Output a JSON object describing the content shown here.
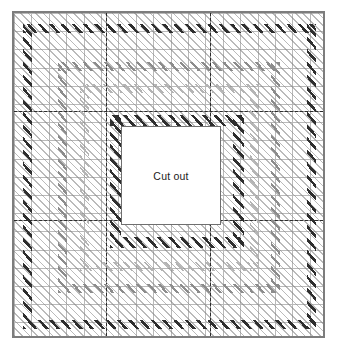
{
  "figure": {
    "type": "mesh-diagram",
    "width_px": 339,
    "height_px": 349
  },
  "plate": {
    "name": "plate-outline",
    "left_px": 12,
    "top_px": 11,
    "width_px": 313,
    "height_px": 327,
    "outline_color": "#7d7d7d",
    "fill_color": "#ffffff",
    "mesh_color": "#b9b9b9",
    "mesh_cols": 18,
    "mesh_rows": 18
  },
  "cutout": {
    "name": "cut-out-region",
    "label": "Cut out",
    "left_px": 119,
    "top_px": 124,
    "width_px": 100,
    "height_px": 99,
    "outline_color": "#6f6f6f",
    "fill_color": "#ffffff",
    "label_color": "#1a1a1a"
  },
  "block_lines": {
    "name": "element-block-dividers",
    "color": "#8a8a8a",
    "vertical_x_px": [
      104,
      208
    ],
    "horizontal_y_px": [
      109,
      218
    ]
  },
  "centre_lines": {
    "name": "centre-lines",
    "style": "dashed",
    "color": "#2b2b2b",
    "vertical_x_px": [
      104,
      208
    ],
    "horizontal_y_px": [
      109,
      218
    ]
  },
  "bands": [
    {
      "name": "reinforcement-band-outer-dark",
      "intensity": "dark",
      "color": "#2e2e2e",
      "left_px": 21,
      "top_px": 22,
      "width_px": 270,
      "height_px": 282,
      "thickness_px": 9
    },
    {
      "name": "reinforcement-band-mid-medium",
      "intensity": "medium",
      "color": "#8c8c8c",
      "left_px": 56,
      "top_px": 60,
      "width_px": 200,
      "height_px": 208,
      "thickness_px": 9
    },
    {
      "name": "reinforcement-band-inner-faint",
      "intensity": "faint",
      "color": "#b4b4b4",
      "left_px": 78,
      "top_px": 82,
      "width_px": 157,
      "height_px": 164,
      "thickness_px": 9
    },
    {
      "name": "reinforcement-band-cutout-dark",
      "intensity": "dark",
      "color": "#2e2e2e",
      "left_px": 108,
      "top_px": 113,
      "width_px": 122,
      "height_px": 121,
      "thickness_px": 11
    }
  ],
  "hatch": {
    "name": "global-light-hatch",
    "color": "#828282",
    "angle_deg": 45
  }
}
